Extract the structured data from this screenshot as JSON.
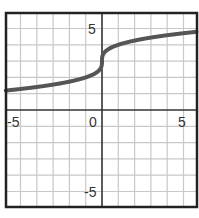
{
  "chart_data": {
    "type": "line",
    "title": "",
    "xlabel": "",
    "ylabel": "",
    "xlim": [
      -5.9,
      5.8
    ],
    "ylim": [
      -5.95,
      5.95
    ],
    "grid": true,
    "grid_step": 1,
    "x_ticks": [
      -5,
      0,
      5
    ],
    "y_ticks": [
      5,
      -5
    ],
    "x_tick_labels": [
      "-5",
      "0",
      "5"
    ],
    "y_tick_labels": [
      "5",
      "-5"
    ],
    "function": "y = cbrt(x) + 3",
    "series": [
      {
        "name": "f(x)",
        "color": "#555555",
        "x": [
          -5.9,
          -5,
          -4,
          -3,
          -2,
          -1,
          -0.5,
          -0.2,
          -0.05,
          0,
          0.05,
          0.2,
          0.5,
          1,
          2,
          3,
          4,
          5,
          5.8
        ],
        "y": [
          1.19,
          1.29,
          1.41,
          1.56,
          1.74,
          2.0,
          2.21,
          2.42,
          2.63,
          3.0,
          3.37,
          3.58,
          3.79,
          4.0,
          4.26,
          4.44,
          4.59,
          4.71,
          4.8
        ]
      }
    ]
  },
  "labels": {
    "x_neg5": "-5",
    "x_0": "0",
    "x_5": "5",
    "y_5": "5",
    "y_neg5": "-5"
  }
}
